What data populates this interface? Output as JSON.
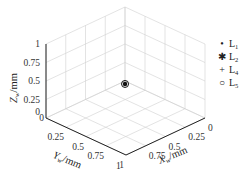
{
  "chart_data": {
    "type": "scatter",
    "projection": "3d",
    "title": "",
    "xlabel": "X_w/mm",
    "ylabel": "Y_w/mm",
    "zlabel": "Z_w/mm",
    "xlim": [
      0,
      1
    ],
    "ylim": [
      0,
      1
    ],
    "zlim": [
      0,
      1
    ],
    "xticks": [
      "0",
      "0.25",
      "0.5",
      "0.75",
      "1"
    ],
    "yticks": [
      "0",
      "0.25",
      "0.5",
      "0.75",
      "1"
    ],
    "zticks": [
      "0",
      "0.25",
      "0.5",
      "0.75",
      "1"
    ],
    "grid": true,
    "legend_position": "right",
    "series": [
      {
        "name": "L1",
        "marker": "dot",
        "points": [
          [
            0.04,
            0.04,
            0.0
          ]
        ]
      },
      {
        "name": "L2",
        "marker": "asterisk",
        "points": [
          [
            0.04,
            0.04,
            0.0
          ]
        ]
      },
      {
        "name": "L4",
        "marker": "plus",
        "points": [
          [
            0.04,
            0.04,
            0.0
          ]
        ]
      },
      {
        "name": "L5",
        "marker": "circle",
        "points": [
          [
            0.04,
            0.04,
            0.0
          ]
        ]
      }
    ]
  },
  "labels": {
    "z_main": "Z",
    "z_sub": "w",
    "z_unit": "/mm",
    "y_main": "Y",
    "y_sub": "w",
    "y_unit": "/mm",
    "x_main": "X",
    "x_sub": "w",
    "x_unit": "/mm"
  },
  "legend": [
    {
      "symbol": "•",
      "main": "L",
      "sub": "1"
    },
    {
      "symbol": "✱",
      "main": "L",
      "sub": "2"
    },
    {
      "symbol": "+",
      "main": "L",
      "sub": "4"
    },
    {
      "symbol": "○",
      "main": "L",
      "sub": "5"
    }
  ],
  "colors": {
    "grid": "#d0d0d0",
    "axis": "#222222",
    "marker": "#111111"
  }
}
